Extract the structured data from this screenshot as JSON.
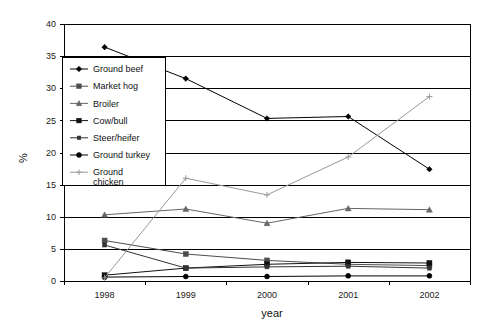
{
  "chart_data": {
    "type": "line",
    "title": "",
    "xlabel": "year",
    "ylabel": "%",
    "categories": [
      "1998",
      "1999",
      "2000",
      "2001",
      "2002"
    ],
    "x": [
      1998,
      1999,
      2000,
      2001,
      2002
    ],
    "ylim": [
      0,
      40
    ],
    "yticks": [
      0,
      5,
      10,
      15,
      20,
      25,
      30,
      35,
      40
    ],
    "ytick_labels": [
      "0",
      "5",
      "10",
      "15",
      "20",
      "25",
      "30",
      "35",
      "40"
    ],
    "grid": true,
    "grid_axis": "y",
    "legend_position": "inside-left",
    "series": [
      {
        "name": "Ground beef",
        "marker": "diamond-filled",
        "color": "#000000",
        "values": [
          36.4,
          31.5,
          25.3,
          25.6,
          17.4
        ]
      },
      {
        "name": "Market hog",
        "marker": "square-filled",
        "color": "#4d4d4d",
        "values": [
          6.3,
          4.2,
          3.2,
          2.6,
          2.4
        ]
      },
      {
        "name": "Broiler",
        "marker": "triangle",
        "color": "#666666",
        "values": [
          10.3,
          11.2,
          9.0,
          11.3,
          11.1
        ]
      },
      {
        "name": "Cow/bull",
        "marker": "square-filled",
        "color": "#111111",
        "values": [
          0.9,
          2.0,
          2.6,
          2.9,
          2.8
        ]
      },
      {
        "name": "Steer/heifer",
        "marker": "square-small",
        "color": "#333333",
        "values": [
          5.6,
          2.0,
          2.2,
          2.3,
          2.0
        ]
      },
      {
        "name": "Ground turkey",
        "marker": "circle-filled",
        "color": "#000000",
        "values": [
          0.6,
          0.7,
          0.7,
          0.8,
          0.8
        ]
      },
      {
        "name": "Ground chicken",
        "marker": "plus",
        "color": "#999999",
        "values": [
          0.5,
          16.0,
          13.4,
          19.3,
          28.7
        ]
      }
    ]
  },
  "legend": {
    "items": [
      {
        "label": "Ground beef"
      },
      {
        "label": "Market hog"
      },
      {
        "label": "Broiler"
      },
      {
        "label": "Cow/bull"
      },
      {
        "label": "Steer/heifer"
      },
      {
        "label": "Ground turkey"
      },
      {
        "label": "Ground",
        "label2": "chicken"
      }
    ]
  },
  "axes": {
    "y_title": "%",
    "x_title": "year"
  }
}
